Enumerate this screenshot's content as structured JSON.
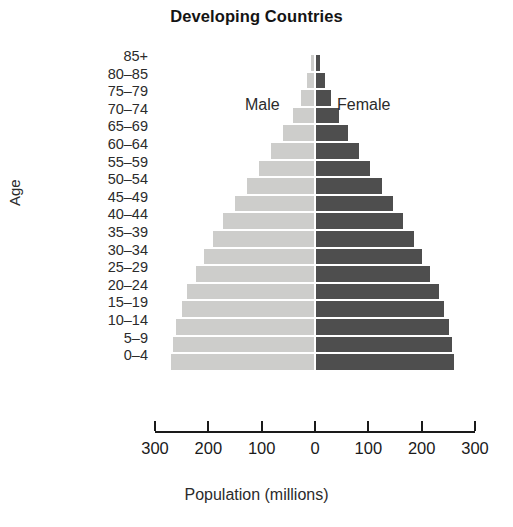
{
  "chart_data": {
    "type": "bar",
    "subtype": "population-pyramid",
    "title": "Developing Countries",
    "xlabel": "Population (millions)",
    "ylabel": "Age",
    "xlim": [
      -300,
      300
    ],
    "xticks": [
      -300,
      -200,
      -100,
      0,
      100,
      200,
      300
    ],
    "xtick_labels": [
      "300",
      "200",
      "100",
      "0",
      "100",
      "200",
      "300"
    ],
    "grid": false,
    "legend_position": "inside-top",
    "categories": [
      "85+",
      "80–85",
      "75–79",
      "70–74",
      "65–69",
      "60–64",
      "55–59",
      "50–54",
      "45–49",
      "40–44",
      "35–39",
      "30–34",
      "25–29",
      "20–24",
      "15–19",
      "10–14",
      "5–9",
      "0–4"
    ],
    "series": [
      {
        "name": "Male",
        "color": "#cdcdcb",
        "side": "left",
        "values": [
          6,
          14,
          25,
          40,
          58,
          80,
          103,
          126,
          148,
          170,
          190,
          207,
          222,
          238,
          248,
          258,
          264,
          268
        ]
      },
      {
        "name": "Female",
        "color": "#4e4e4e",
        "side": "right",
        "values": [
          7,
          16,
          28,
          43,
          60,
          81,
          102,
          124,
          144,
          164,
          183,
          199,
          214,
          230,
          240,
          250,
          255,
          258
        ]
      }
    ]
  },
  "labels": {
    "male": "Male",
    "female": "Female"
  }
}
